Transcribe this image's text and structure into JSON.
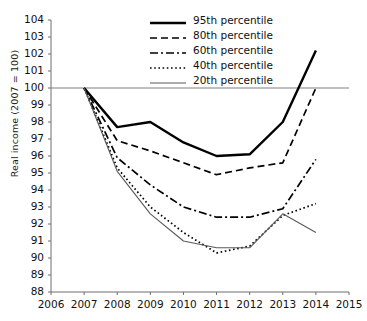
{
  "chart_data": {
    "type": "line",
    "title": "",
    "xlabel": "",
    "ylabel": "Real income (2007 = 100)",
    "xlim": [
      2006,
      2015
    ],
    "ylim": [
      88,
      104
    ],
    "grid": false,
    "legend_position": "top-right",
    "xticks": [
      "2006",
      "2007",
      "2008",
      "2009",
      "2010",
      "2011",
      "2012",
      "2013",
      "2014",
      "2015"
    ],
    "yticks": [
      "88",
      "89",
      "90",
      "91",
      "92",
      "93",
      "94",
      "95",
      "96",
      "97",
      "98",
      "99",
      "100",
      "101",
      "102",
      "103",
      "104"
    ],
    "reference_line": {
      "value": 100,
      "color": "#808080"
    },
    "x": [
      2007,
      2008,
      2009,
      2010,
      2011,
      2012,
      2013,
      2014
    ],
    "series": [
      {
        "name": "95th percentile",
        "style": "solid-thick",
        "color": "#000000",
        "values": [
          100.0,
          97.7,
          98.0,
          96.8,
          96.0,
          96.1,
          98.0,
          102.2
        ]
      },
      {
        "name": "80th percentile",
        "style": "dashed",
        "color": "#000000",
        "values": [
          100.0,
          96.9,
          96.3,
          95.6,
          94.9,
          95.3,
          95.6,
          100.0
        ]
      },
      {
        "name": "60th percentile",
        "style": "dash-dot",
        "color": "#000000",
        "values": [
          100.0,
          95.9,
          94.3,
          93.0,
          92.4,
          92.4,
          92.9,
          95.8
        ]
      },
      {
        "name": "40th percentile",
        "style": "dotted",
        "color": "#000000",
        "values": [
          100.0,
          95.3,
          93.0,
          91.5,
          90.3,
          90.7,
          92.5,
          93.2
        ]
      },
      {
        "name": "20th percentile",
        "style": "solid-thin",
        "color": "#595959",
        "values": [
          100.0,
          95.1,
          92.6,
          91.0,
          90.6,
          90.6,
          92.6,
          91.5
        ]
      }
    ]
  },
  "legend": {
    "items": [
      {
        "label": "95th percentile"
      },
      {
        "label": "80th percentile"
      },
      {
        "label": "60th percentile"
      },
      {
        "label": "40th percentile"
      },
      {
        "label": "20th percentile"
      }
    ]
  }
}
